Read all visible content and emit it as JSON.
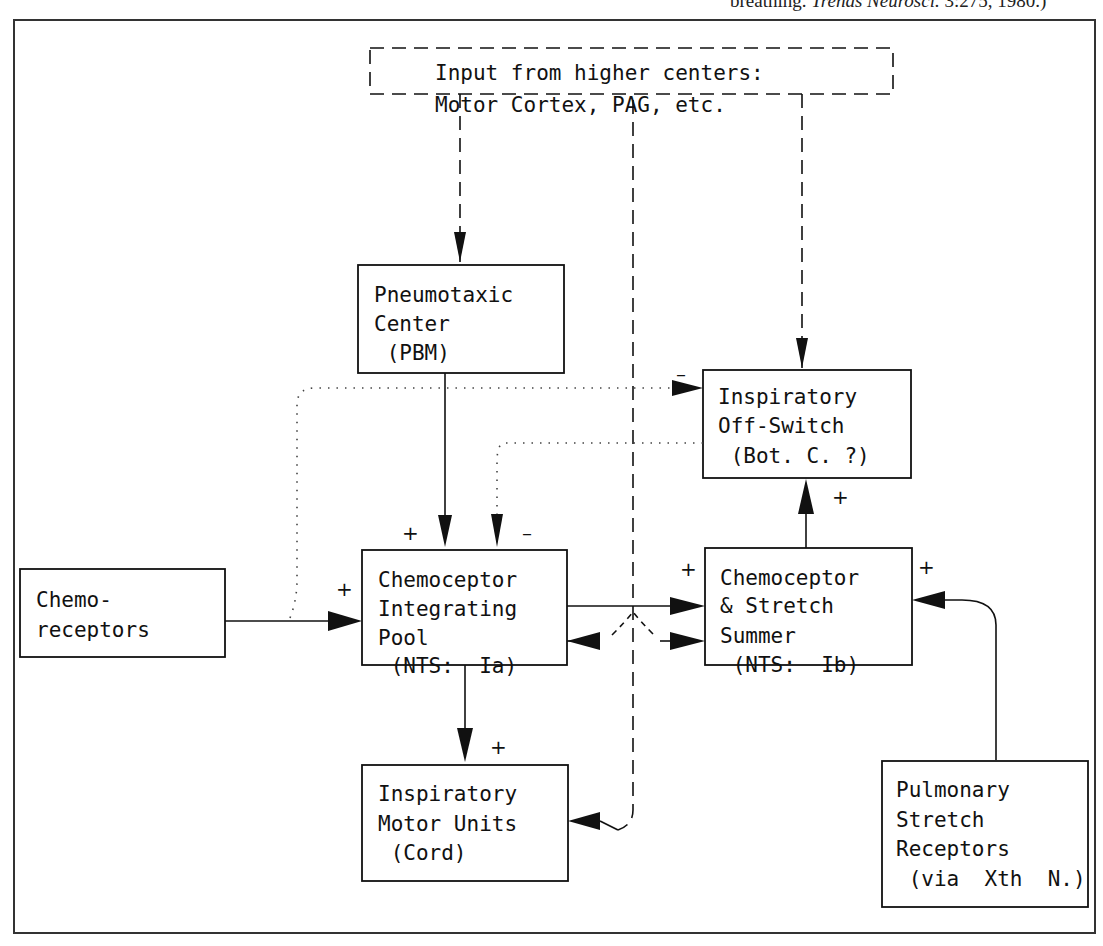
{
  "caption": {
    "prefix": "breathing. ",
    "journal": "Trends Neurosci.",
    "suffix": " 3:275, 1980.)"
  },
  "nodes": {
    "higher_centers": {
      "lines": [
        "Input from higher centers:",
        "Motor Cortex, PAG, etc."
      ],
      "style": "dashed"
    },
    "pneumotaxic": {
      "lines": [
        "Pneumotaxic",
        "Center",
        " (PBM)"
      ]
    },
    "off_switch": {
      "lines": [
        "Inspiratory",
        "Off-Switch",
        " (Bot. C. ?)"
      ]
    },
    "chemoreceptors": {
      "lines": [
        "Chemo-",
        "receptors"
      ]
    },
    "integrating_pool": {
      "lines": [
        "Chemoceptor",
        "Integrating",
        "Pool",
        " (NTS:  Ia)"
      ]
    },
    "summer": {
      "lines": [
        "Chemoceptor",
        "& Stretch",
        "Summer",
        " (NTS:  Ib)"
      ]
    },
    "motor_units": {
      "lines": [
        "Inspiratory",
        "Motor Units",
        " (Cord)"
      ]
    },
    "stretch_receptors": {
      "lines": [
        "Pulmonary",
        "Stretch",
        "Receptors",
        " (via  Xth  N.)"
      ]
    }
  },
  "signs": {
    "plus": "+",
    "minus": "–"
  },
  "legend": {
    "solid": "excitatory/direct pathway",
    "dashed": "input from higher centers",
    "dotted": "chemoreceptor / off-switch feedback"
  }
}
